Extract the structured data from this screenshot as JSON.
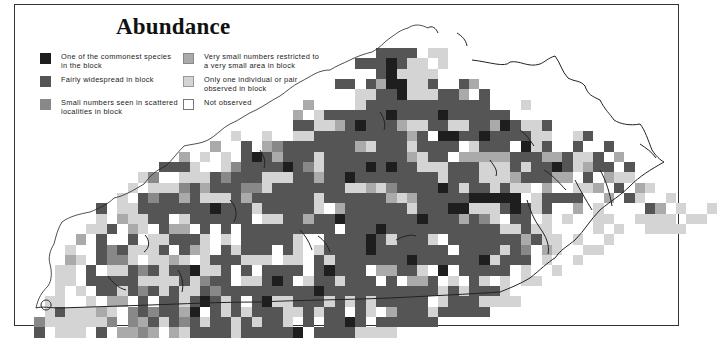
{
  "title": "Abundance",
  "legend": [
    {
      "code": "1",
      "label": "One of the commonest species in the block",
      "color": "#1e1e1e"
    },
    {
      "code": "2",
      "label": "Fairly widespread in block",
      "color": "#555555"
    },
    {
      "code": "3",
      "label": "Small numbers seen in scattered localities in block",
      "color": "#888888"
    },
    {
      "code": "4",
      "label": "Very small numbers restricted to a very small area in block",
      "color": "#aaaaaa"
    },
    {
      "code": "5",
      "label": "Only one individual or pair observed in block",
      "color": "#d4d4d4"
    },
    {
      "code": "w",
      "label": "Not observed",
      "color": "#ffffff"
    }
  ],
  "grid": {
    "origin_x": 24,
    "origin_y": 8,
    "cell": 10.35,
    "rows": [
      "..................................2222w55..........................",
      "................................2221255w5..........................",
      "..................................215555w..........................",
      "..............................22.2411552..24......................",
      "................................55221555224.2......................",
      "...........................4....5222222222222...5...................",
      "..........................4w5222222122221222222.....................",
      "..........................2255421222455225522412552.................",
      "....................5..5.w5522222222242w11221222255..52..............",
      "..................4..2.4322222224522252222w5222w152..2..2.............",
      "...............4.5.5.21242225222222224522w44444222442552.4............",
      ".............2225w.53222212352222121225552225552522125422.2..........",
      "...........53..55523222555224221222222225222555422244.2w455..........",
      "..........5w5553242223352222222554532222125225255w4ww554.2w45.........",
      ".........5w2322425552422222252222224542222211111w52222ww4w25..5........",
      ".......2w55222222212225222225w422222252221155521252ww4.5wwww24.5w.5...",
      ".......5w45522w5222222w55224221222222212224235w22w5w5ww55ww5555.55....",
      "......552w45w244w2w2w222222222w22212222222222255255wwww5w5w.5555......",
      ".....4w2ww2w552225w5w222225ww22221252225w22222224255w5ww5.........",
      "....5.w2325552w245w25222w25w5222212222222w2222523.45ww55...........",
      "....45w2335w5545w5222555w55w252222222122222215222w5ww5.............",
      "...55w2w552325221552w2w2222w21222w44225w1w22222w5ww5...............",
      "...55w22222555525322w55212w5225222w2w442w5w25w5w55.................",
      "...5w5w2252325255232222222221222222222225252225ww..................",
      "..55ww5w44w2w22521252w21552225252522222w52225555...................",
      "..5255545w3232241w2525222552522w25w4222522222......................",
      ".35555553w3425232522525225w2w2212w222222...........................",
      ".2.555w2w4434w4522225222221w22225555..............................."
    ]
  }
}
